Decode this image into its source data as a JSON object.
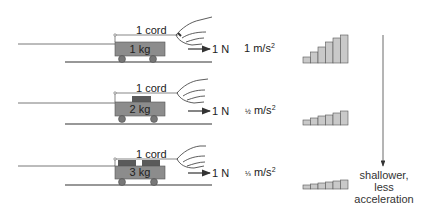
{
  "rows": [
    {
      "cord_label": "1 cord",
      "mass_label": "1 kg",
      "force_label": "1 N",
      "accel_label": "1 m/s",
      "accel_exp": "2",
      "accel_prefix": "",
      "weights": 0,
      "staircase": {
        "heights": [
          6,
          11,
          16,
          21,
          26,
          30
        ]
      }
    },
    {
      "cord_label": "1 cord",
      "mass_label": "2 kg",
      "force_label": "1 N",
      "accel_label": " m/s",
      "accel_exp": "2",
      "accel_prefix": "½",
      "weights": 1,
      "staircase": {
        "heights": [
          5,
          7,
          9,
          11,
          13,
          15
        ]
      }
    },
    {
      "cord_label": "1 cord",
      "mass_label": "3 kg",
      "force_label": "1 N",
      "accel_label": " m/s",
      "accel_exp": "2",
      "accel_prefix": "⅓",
      "weights": 2,
      "staircase": {
        "heights": [
          4,
          5,
          7,
          8,
          9,
          10
        ]
      }
    }
  ],
  "trend_note": {
    "line1": "shallower,",
    "line2": "less",
    "line3": "acceleration"
  },
  "colors": {
    "cart": "#8c8c8c",
    "weight": "#5a5a5a",
    "bar": "#c9c9c9",
    "line": "#333333"
  }
}
